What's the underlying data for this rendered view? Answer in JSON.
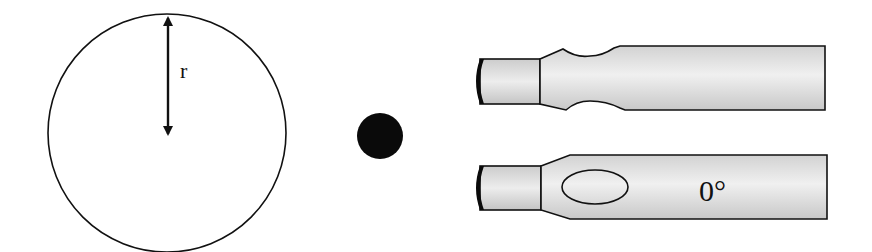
{
  "diagram": {
    "circle": {
      "radius_label": "r"
    },
    "dot": {
      "description": "solid black dot"
    },
    "tools": [
      {
        "name": "notched-tip",
        "label": ""
      },
      {
        "name": "oval-window-tip",
        "label": "0°"
      }
    ],
    "colors": {
      "stroke": "#111111",
      "fill_dark": "#0a0a0a",
      "metal_light": "#ececec",
      "metal_mid": "#cfcfcf",
      "background": "#ffffff"
    }
  }
}
